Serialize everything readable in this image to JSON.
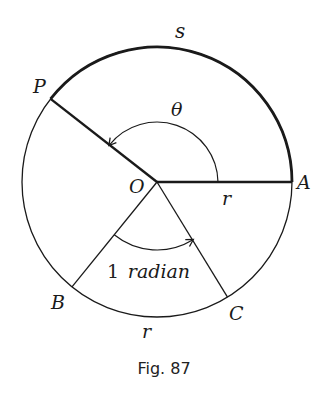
{
  "figure": {
    "caption": "Fig. 87",
    "center_label": "O",
    "points": {
      "P": "P",
      "A": "A",
      "B": "B",
      "C": "C"
    },
    "arc_label": "s",
    "angle_label": "θ",
    "radius_label_OA": "r",
    "radius_label_arc_BC": "r",
    "radian_number": "1",
    "radian_word": "radian"
  },
  "colors": {
    "stroke": "#1a1a1a",
    "background": "#ffffff"
  }
}
